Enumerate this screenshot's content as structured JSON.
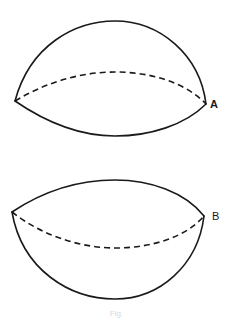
{
  "figure": {
    "shapes": [
      {
        "id": "A",
        "label": "A",
        "description": "Upper hemisphere-like dome with solid upper arc, dashed back rim, solid front rim",
        "left_point": [
          15,
          101
        ],
        "right_point": [
          206,
          104
        ],
        "upper_arc_apex_y": 21,
        "dashed_arc_apex_y": 72,
        "lower_arc_bottom_y": 136
      },
      {
        "id": "B",
        "label": "B",
        "description": "Lower bowl-like shape with solid upper rim, dashed back rim, solid lower arc",
        "left_point": [
          12,
          212
        ],
        "right_point": [
          204,
          216
        ],
        "upper_arc_apex_y": 180,
        "dashed_arc_bottom_y": 248,
        "lower_arc_bottom_y": 299
      }
    ],
    "caption": "Fig."
  },
  "colors": {
    "stroke": "#1a1a1a",
    "background": "#ffffff"
  }
}
